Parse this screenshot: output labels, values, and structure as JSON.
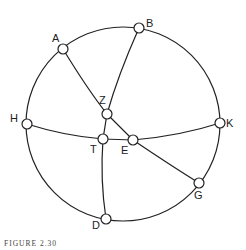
{
  "figure": {
    "caption": "FIGURE 2.30",
    "nodes": [
      {
        "id": "A",
        "x": 63,
        "y": 49,
        "lx": 52,
        "ly": 42
      },
      {
        "id": "B",
        "x": 139,
        "y": 28,
        "lx": 146,
        "ly": 27
      },
      {
        "id": "H",
        "x": 27,
        "y": 124,
        "lx": 10,
        "ly": 122
      },
      {
        "id": "K",
        "x": 220,
        "y": 123,
        "lx": 226,
        "ly": 127
      },
      {
        "id": "Z",
        "x": 107,
        "y": 114,
        "lx": 99,
        "ly": 104
      },
      {
        "id": "T",
        "x": 103,
        "y": 139,
        "lx": 90,
        "ly": 153
      },
      {
        "id": "E",
        "x": 133,
        "y": 140,
        "lx": 121,
        "ly": 154
      },
      {
        "id": "G",
        "x": 199,
        "y": 183,
        "lx": 194,
        "ly": 199
      },
      {
        "id": "D",
        "x": 106,
        "y": 219,
        "lx": 92,
        "ly": 229
      }
    ],
    "edges": [
      "circle H-A-B-K-G-D",
      "arc A-Z-E-G",
      "arc B-Z-T-D",
      "arc H-T-E-K"
    ]
  }
}
